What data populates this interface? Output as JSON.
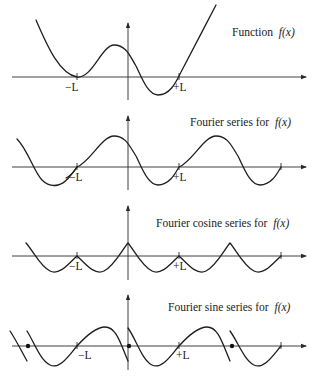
{
  "panels": [
    {
      "id": "function",
      "title": "Function",
      "fx": "f(x)",
      "tick_labels": [
        "−L",
        "+L"
      ]
    },
    {
      "id": "fourier-series",
      "title": "Fourier series for",
      "fx": "f(x)",
      "tick_labels": [
        "−L",
        "+L"
      ]
    },
    {
      "id": "fourier-cosine-series",
      "title": "Fourier cosine series for",
      "fx": "f(x)",
      "tick_labels": [
        "−L",
        "+L"
      ]
    },
    {
      "id": "fourier-sine-series",
      "title": "Fourier sine series for",
      "fx": "f(x)",
      "tick_labels": [
        "−L",
        "+L"
      ]
    }
  ]
}
